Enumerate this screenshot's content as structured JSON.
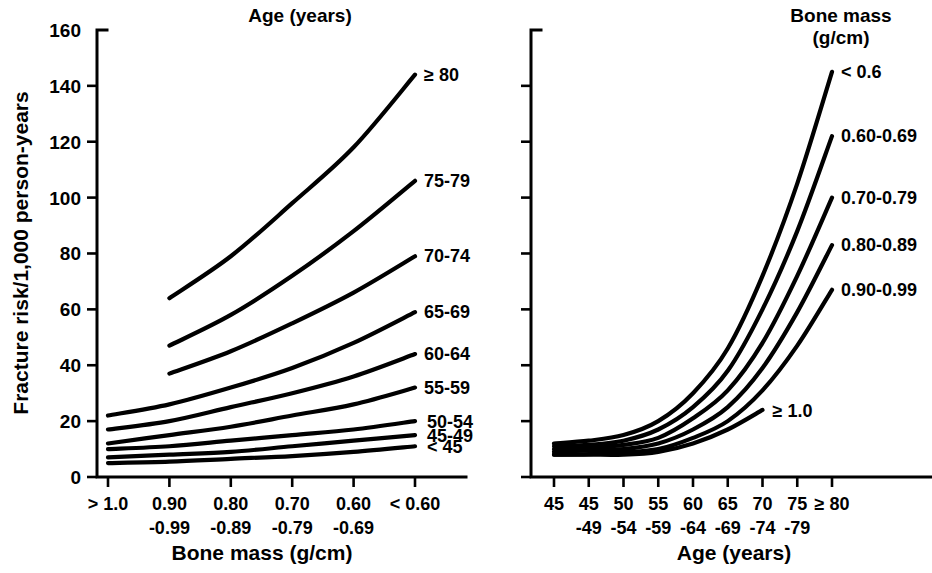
{
  "figure": {
    "background": "#ffffff",
    "ink_color": "#000000"
  },
  "panels": {
    "left": {
      "legend_title": "Age (years)",
      "xlabel": "Bone mass (g/cm)",
      "ylabel": "Fracture risk/1,000 person-years",
      "ytick_labels": [
        "0",
        "20",
        "40",
        "60",
        "80",
        "100",
        "120",
        "140",
        "160"
      ],
      "xtick_top": [
        "> 1.0",
        "0.90",
        "0.80",
        "0.70",
        "0.60",
        "< 0.60"
      ],
      "xtick_bottom": [
        "",
        "-0.99",
        "-0.89",
        "-0.79",
        "-0.69",
        ""
      ],
      "curve_labels": [
        "≥ 80",
        "75-79",
        "70-74",
        "65-69",
        "60-64",
        "55-59",
        "50-54",
        "45-49",
        "< 45"
      ]
    },
    "right": {
      "legend_title_line1": "Bone mass",
      "legend_title_line2": "(g/cm)",
      "xlabel": "Age (years)",
      "xtick_top": [
        "45",
        "45",
        "50",
        "55",
        "60",
        "65",
        "70",
        "75",
        "≥ 80"
      ],
      "xtick_bottom": [
        "",
        "-49",
        "-54",
        "-59",
        "-64",
        "-69",
        "-74",
        "-79",
        ""
      ],
      "curve_labels": [
        "< 0.6",
        "0.60-0.69",
        "0.70-0.79",
        "0.80-0.89",
        "0.90-0.99",
        "≥ 1.0"
      ]
    }
  },
  "chart_data": [
    {
      "type": "line",
      "panel": "left",
      "title": "Age (years)",
      "xlabel": "Bone mass (g/cm)",
      "ylabel": "Fracture risk/1,000 person-years",
      "categories": [
        "> 1.0",
        "0.90-0.99",
        "0.80-0.89",
        "0.70-0.79",
        "0.60-0.69",
        "< 0.60"
      ],
      "ylim": [
        0,
        160
      ],
      "yticks": [
        0,
        20,
        40,
        60,
        80,
        100,
        120,
        140,
        160
      ],
      "grid": false,
      "legend_position": "curve-end-labels",
      "series": [
        {
          "name": "≥ 80",
          "x": [
            "0.90-0.99",
            "0.80-0.89",
            "0.70-0.79",
            "0.60-0.69",
            "< 0.60"
          ],
          "values": [
            64,
            79,
            98,
            118,
            144
          ]
        },
        {
          "name": "75-79",
          "x": [
            "0.90-0.99",
            "0.80-0.89",
            "0.70-0.79",
            "0.60-0.69",
            "< 0.60"
          ],
          "values": [
            47,
            58,
            72,
            88,
            106
          ]
        },
        {
          "name": "70-74",
          "x": [
            "0.90-0.99",
            "0.80-0.89",
            "0.70-0.79",
            "0.60-0.69",
            "< 0.60"
          ],
          "values": [
            37,
            45,
            55,
            66,
            79
          ]
        },
        {
          "name": "65-69",
          "x": [
            "> 1.0",
            "0.90-0.99",
            "0.80-0.89",
            "0.70-0.79",
            "0.60-0.69",
            "< 0.60"
          ],
          "values": [
            22,
            26,
            32,
            39,
            48,
            59
          ]
        },
        {
          "name": "60-64",
          "x": [
            "> 1.0",
            "0.90-0.99",
            "0.80-0.89",
            "0.70-0.79",
            "0.60-0.69",
            "< 0.60"
          ],
          "values": [
            17,
            20,
            25,
            30,
            36,
            44
          ]
        },
        {
          "name": "55-59",
          "x": [
            "> 1.0",
            "0.90-0.99",
            "0.80-0.89",
            "0.70-0.79",
            "0.60-0.69",
            "< 0.60"
          ],
          "values": [
            12,
            15,
            18,
            22,
            26,
            32
          ]
        },
        {
          "name": "50-54",
          "x": [
            "> 1.0",
            "0.90-0.99",
            "0.80-0.89",
            "0.70-0.79",
            "0.60-0.69",
            "< 0.60"
          ],
          "values": [
            10,
            11,
            13,
            15,
            17,
            20
          ]
        },
        {
          "name": "45-49",
          "x": [
            "> 1.0",
            "0.90-0.99",
            "0.80-0.89",
            "0.70-0.79",
            "0.60-0.69",
            "< 0.60"
          ],
          "values": [
            7,
            8,
            9,
            11,
            13,
            15
          ]
        },
        {
          "name": "< 45",
          "x": [
            "> 1.0",
            "0.90-0.99",
            "0.80-0.89",
            "0.70-0.79",
            "0.60-0.69",
            "< 0.60"
          ],
          "values": [
            5,
            5.5,
            6.5,
            7.5,
            9,
            11
          ]
        }
      ]
    },
    {
      "type": "line",
      "panel": "right",
      "title": "Bone mass (g/cm)",
      "xlabel": "Age (years)",
      "ylabel": "Fracture risk/1,000 person-years",
      "categories": [
        "45",
        "45-49",
        "50-54",
        "55-59",
        "60-64",
        "65-69",
        "70-74",
        "75-79",
        "≥ 80"
      ],
      "ylim": [
        0,
        160
      ],
      "yticks": [
        0,
        20,
        40,
        60,
        80,
        100,
        120,
        140,
        160
      ],
      "grid": false,
      "legend_position": "curve-end-labels",
      "series": [
        {
          "name": "< 0.6",
          "x": [
            "45",
            "45-49",
            "50-54",
            "55-59",
            "60-64",
            "65-69",
            "70-74",
            "75-79",
            "≥ 80"
          ],
          "values": [
            12,
            13,
            15,
            20,
            30,
            46,
            72,
            105,
            145
          ]
        },
        {
          "name": "0.60-0.69",
          "x": [
            "45",
            "45-49",
            "50-54",
            "55-59",
            "60-64",
            "65-69",
            "70-74",
            "75-79",
            "≥ 80"
          ],
          "values": [
            11,
            11.5,
            13,
            17,
            25,
            38,
            60,
            88,
            122
          ]
        },
        {
          "name": "0.70-0.79",
          "x": [
            "45",
            "45-49",
            "50-54",
            "55-59",
            "60-64",
            "65-69",
            "70-74",
            "75-79",
            "≥ 80"
          ],
          "values": [
            10,
            10.5,
            11.5,
            14,
            21,
            31,
            48,
            72,
            100
          ]
        },
        {
          "name": "0.80-0.89",
          "x": [
            "45",
            "45-49",
            "50-54",
            "55-59",
            "60-64",
            "65-69",
            "70-74",
            "75-79",
            "≥ 80"
          ],
          "values": [
            9,
            9.5,
            10,
            12,
            17,
            25,
            39,
            59,
            83
          ]
        },
        {
          "name": "0.90-0.99",
          "x": [
            "45",
            "45-49",
            "50-54",
            "55-59",
            "60-64",
            "65-69",
            "70-74",
            "75-79",
            "≥ 80"
          ],
          "values": [
            8,
            8.2,
            8.8,
            10,
            14,
            20,
            31,
            47,
            67
          ]
        },
        {
          "name": "≥ 1.0",
          "x": [
            "45",
            "45-49",
            "50-54",
            "55-59",
            "60-64",
            "65-69",
            "70-74"
          ],
          "values": [
            8,
            8,
            8,
            9,
            12,
            17,
            24
          ]
        }
      ]
    }
  ],
  "geometry": {
    "note": "pixel layout constants for the rendered figure",
    "left": {
      "x0": 108,
      "dx": 61.4,
      "y0": 477,
      "ytop": 30,
      "yscale": 2.794,
      "axis_x": 97,
      "axis_bottom": 477,
      "axis_right": 466
    },
    "right": {
      "x0": 554,
      "dx": 34.75,
      "y0": 477,
      "ytop": 30,
      "yscale": 2.794,
      "axis_x": 531,
      "axis_bottom": 477,
      "axis_right": 932
    }
  }
}
